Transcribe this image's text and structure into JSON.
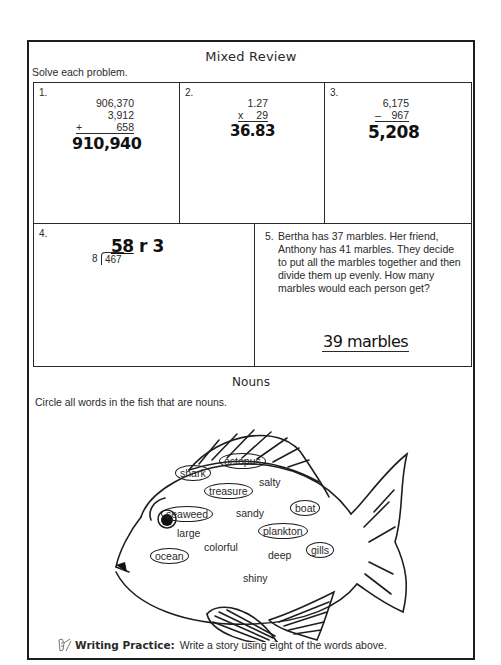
{
  "worksheet": {
    "title": "Mixed Review",
    "instruction": "Solve each problem."
  },
  "problems": [
    {
      "number": "1.",
      "operands": [
        "906,370",
        "3,912"
      ],
      "operator": "+",
      "last_operand": "658",
      "answer": "910,940"
    },
    {
      "number": "2.",
      "operands": [
        "1.27"
      ],
      "operator": "x",
      "last_operand": "29",
      "answer": "36.83"
    },
    {
      "number": "3.",
      "operands": [
        "6,175"
      ],
      "operator": "–",
      "last_operand": "967",
      "answer": "5,208"
    },
    {
      "number": "4.",
      "divisor": "8",
      "dividend": "467",
      "quotient": "58",
      "remainder_label": "r 3"
    },
    {
      "number": "5.",
      "text": "Bertha has 37 marbles.  Her friend, Anthony has 41 marbles.  They decide to put all the marbles together and then divide them up evenly.  How many marbles would each person get?",
      "answer": "39 marbles"
    }
  ],
  "nouns": {
    "title": "Nouns",
    "instruction": "Circle all words in the fish that are nouns.",
    "words": [
      {
        "text": "shark",
        "circled": true
      },
      {
        "text": "octopus",
        "circled": true
      },
      {
        "text": "salty",
        "circled": false
      },
      {
        "text": "treasure",
        "circled": true
      },
      {
        "text": "boat",
        "circled": true
      },
      {
        "text": "seaweed",
        "circled": true
      },
      {
        "text": "sandy",
        "circled": false
      },
      {
        "text": "large",
        "circled": false
      },
      {
        "text": "plankton",
        "circled": true
      },
      {
        "text": "colorful",
        "circled": false
      },
      {
        "text": "deep",
        "circled": false
      },
      {
        "text": "gills",
        "circled": true
      },
      {
        "text": "ocean",
        "circled": true
      },
      {
        "text": "shiny",
        "circled": false
      }
    ]
  },
  "footer": {
    "icon": "writing-hand-icon",
    "label": "Writing Practice:",
    "text": "Write a story using eight of the words above."
  }
}
